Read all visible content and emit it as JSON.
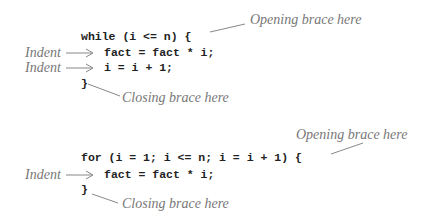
{
  "example1": {
    "code": {
      "line1": "while (i <= n) {",
      "line2": "fact = fact * i;",
      "line3": "i = i + 1;",
      "line4": "}"
    },
    "annotations": {
      "opening": "Opening brace here",
      "indent1": "Indent",
      "indent2": "Indent",
      "closing": "Closing brace here"
    }
  },
  "example2": {
    "code": {
      "line1": "for (i = 1; i <= n; i = i + 1) {",
      "line2": "fact = fact * i;",
      "line3": "}"
    },
    "annotations": {
      "opening": "Opening brace here",
      "indent1": "Indent",
      "closing": "Closing brace here"
    }
  }
}
